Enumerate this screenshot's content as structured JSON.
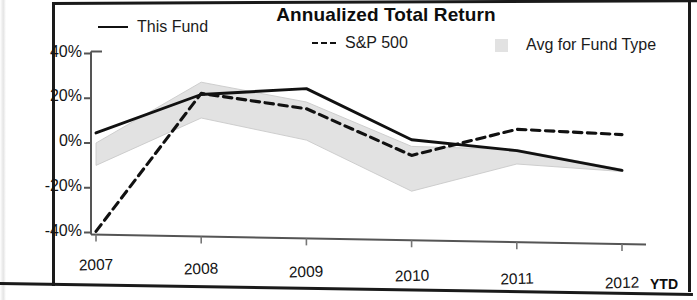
{
  "chart_data": {
    "type": "line",
    "title": "Annualized Total Return",
    "xlabel": "",
    "ylabel": "",
    "categories": [
      "2007",
      "2008",
      "2009",
      "2010",
      "2011",
      "2012"
    ],
    "x_tick_suffix": "YTD",
    "ylim": [
      -40,
      40
    ],
    "y_ticks": [
      40,
      20,
      0,
      -20,
      -40
    ],
    "y_tick_labels": [
      "40%",
      "20%",
      "0%",
      "-20%",
      "-40%"
    ],
    "grid": false,
    "legend_position": "top",
    "series": [
      {
        "name": "This Fund",
        "style": "solid",
        "color": "#111111",
        "values": [
          4.5,
          22.5,
          26.0,
          4.0,
          0.0,
          -8.0
        ]
      },
      {
        "name": "S&P 500",
        "style": "dashed",
        "color": "#111111",
        "values": [
          -39.5,
          23.0,
          17.0,
          -3.0,
          9.5,
          8.0
        ]
      },
      {
        "name": "Avg for Fund Type",
        "style": "band",
        "color": "#e2e2e2",
        "band_upper": [
          0.0,
          28.0,
          20.0,
          1.0,
          0.5,
          -7.5
        ],
        "band_lower": [
          -10.0,
          12.0,
          3.0,
          -19.0,
          -6.0,
          -8.5
        ]
      }
    ]
  },
  "header": {
    "title": "Annualized Total Return"
  },
  "legend": {
    "items": [
      {
        "label": "This Fund",
        "swatch": "solid-line-swatch"
      },
      {
        "label": "S&P 500",
        "swatch": "dashed-line-swatch"
      },
      {
        "label": "Avg for Fund Type",
        "swatch": "gray-band-swatch"
      }
    ]
  },
  "y_axis": {
    "labels": [
      "40%",
      "20%",
      "0%",
      "-20%",
      "-40%"
    ]
  },
  "x_axis": {
    "labels": [
      "2007",
      "2008",
      "2009",
      "2010",
      "2011",
      "2012"
    ],
    "suffix": "YTD"
  }
}
